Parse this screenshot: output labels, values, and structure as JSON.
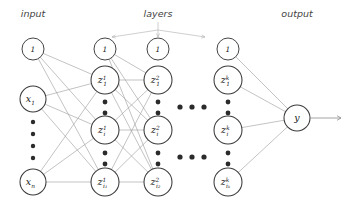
{
  "figure": {
    "type": "neural-network-diagram",
    "title": "",
    "background_color": "#ffffff",
    "node_stroke_color": "#3a3a3a",
    "edge_color": "#9a9a9a",
    "text_color": "#1a1a1a",
    "header_color": "#444444"
  },
  "headers": {
    "input": "input",
    "layers": "layers",
    "output": "output"
  },
  "columns": [
    {
      "id": "input",
      "header": "input",
      "x": 33,
      "nodes": [
        {
          "id": "input-bias",
          "kind": "bias",
          "base": "1",
          "sup": "",
          "sub": "",
          "cx": 33,
          "cy": 49,
          "r": 11
        },
        {
          "id": "input-x1",
          "kind": "unit",
          "base": "x",
          "sup": "",
          "sub": "1",
          "cx": 33,
          "cy": 99,
          "r": 13
        },
        {
          "id": "input-xn",
          "kind": "unit",
          "base": "x",
          "sup": "",
          "sub": "n",
          "cx": 33,
          "cy": 182,
          "r": 13
        }
      ],
      "vertical_ellipsis": [
        {
          "cx": 33,
          "cy": 122,
          "r": 2.2
        },
        {
          "cx": 33,
          "cy": 134,
          "r": 2.2
        },
        {
          "cx": 33,
          "cy": 146,
          "r": 2.2
        },
        {
          "cx": 33,
          "cy": 158,
          "r": 2.2
        }
      ]
    },
    {
      "id": "layer1",
      "header": "",
      "x": 105,
      "nodes": [
        {
          "id": "l1-bias",
          "kind": "bias",
          "base": "1",
          "sup": "",
          "sub": "",
          "cx": 105,
          "cy": 49,
          "r": 11
        },
        {
          "id": "l1-z1",
          "kind": "unit",
          "base": "z",
          "sup": "1",
          "sub": "1",
          "cx": 105,
          "cy": 80,
          "r": 14
        },
        {
          "id": "l1-zi",
          "kind": "unit",
          "base": "z",
          "sup": "1",
          "sub": "i",
          "cx": 105,
          "cy": 130,
          "r": 14
        },
        {
          "id": "l1-zi1",
          "kind": "unit",
          "base": "z",
          "sup": "1",
          "sub": "i₁",
          "cx": 105,
          "cy": 182,
          "r": 14
        }
      ],
      "vertical_ellipsis": [
        {
          "cx": 105,
          "cy": 102,
          "r": 2.4
        },
        {
          "cx": 105,
          "cy": 113,
          "r": 2.4
        },
        {
          "cx": 105,
          "cy": 153,
          "r": 2.4
        },
        {
          "cx": 105,
          "cy": 164,
          "r": 2.4
        }
      ]
    },
    {
      "id": "layer2",
      "header": "",
      "x": 158,
      "nodes": [
        {
          "id": "l2-bias",
          "kind": "bias",
          "base": "1",
          "sup": "",
          "sub": "",
          "cx": 158,
          "cy": 49,
          "r": 11
        },
        {
          "id": "l2-z1",
          "kind": "unit",
          "base": "z",
          "sup": "2",
          "sub": "1",
          "cx": 158,
          "cy": 80,
          "r": 14
        },
        {
          "id": "l2-zi",
          "kind": "unit",
          "base": "z",
          "sup": "2",
          "sub": "i",
          "cx": 158,
          "cy": 130,
          "r": 14
        },
        {
          "id": "l2-zi2",
          "kind": "unit",
          "base": "z",
          "sup": "2",
          "sub": "i₂",
          "cx": 158,
          "cy": 182,
          "r": 14
        }
      ],
      "vertical_ellipsis": [
        {
          "cx": 158,
          "cy": 102,
          "r": 2.4
        },
        {
          "cx": 158,
          "cy": 113,
          "r": 2.4
        },
        {
          "cx": 158,
          "cy": 153,
          "r": 2.4
        },
        {
          "cx": 158,
          "cy": 164,
          "r": 2.4
        }
      ]
    },
    {
      "id": "layerk",
      "header": "",
      "x": 228,
      "nodes": [
        {
          "id": "lk-bias",
          "kind": "bias",
          "base": "1",
          "sup": "",
          "sub": "",
          "cx": 228,
          "cy": 49,
          "r": 11
        },
        {
          "id": "lk-z1",
          "kind": "unit",
          "base": "z",
          "sup": "k",
          "sub": "1",
          "cx": 228,
          "cy": 80,
          "r": 14
        },
        {
          "id": "lk-zi",
          "kind": "unit",
          "base": "z",
          "sup": "k",
          "sub": "i",
          "cx": 228,
          "cy": 130,
          "r": 14
        },
        {
          "id": "lk-zik",
          "kind": "unit",
          "base": "z",
          "sup": "k",
          "sub": "iₖ",
          "cx": 228,
          "cy": 182,
          "r": 14
        }
      ],
      "vertical_ellipsis": [
        {
          "cx": 228,
          "cy": 102,
          "r": 2.4
        },
        {
          "cx": 228,
          "cy": 113,
          "r": 2.4
        },
        {
          "cx": 228,
          "cy": 153,
          "r": 2.4
        },
        {
          "cx": 228,
          "cy": 164,
          "r": 2.4
        }
      ]
    },
    {
      "id": "output",
      "header": "output",
      "x": 297,
      "nodes": [
        {
          "id": "output-y",
          "kind": "unit",
          "base": "y",
          "sup": "",
          "sub": "",
          "cx": 297,
          "cy": 118,
          "r": 13
        }
      ],
      "vertical_ellipsis": []
    }
  ],
  "horizontal_ellipsis": [
    {
      "cx": 180,
      "cy": 107,
      "r": 2.6
    },
    {
      "cx": 192,
      "cy": 107,
      "r": 2.6
    },
    {
      "cx": 204,
      "cy": 107,
      "r": 2.6
    },
    {
      "cx": 180,
      "cy": 157,
      "r": 2.6
    },
    {
      "cx": 192,
      "cy": 157,
      "r": 2.6
    },
    {
      "cx": 204,
      "cy": 157,
      "r": 2.6
    }
  ],
  "edges": [
    {
      "from": "input-bias",
      "to": "l1-z1"
    },
    {
      "from": "input-bias",
      "to": "l1-zi"
    },
    {
      "from": "input-bias",
      "to": "l1-zi1"
    },
    {
      "from": "input-x1",
      "to": "l1-z1"
    },
    {
      "from": "input-x1",
      "to": "l1-zi"
    },
    {
      "from": "input-x1",
      "to": "l1-zi1"
    },
    {
      "from": "input-xn",
      "to": "l1-z1"
    },
    {
      "from": "input-xn",
      "to": "l1-zi"
    },
    {
      "from": "input-xn",
      "to": "l1-zi1"
    },
    {
      "from": "l1-bias",
      "to": "l2-z1"
    },
    {
      "from": "l1-bias",
      "to": "l2-zi"
    },
    {
      "from": "l1-bias",
      "to": "l2-zi2"
    },
    {
      "from": "l1-z1",
      "to": "l2-z1"
    },
    {
      "from": "l1-z1",
      "to": "l2-zi"
    },
    {
      "from": "l1-z1",
      "to": "l2-zi2"
    },
    {
      "from": "l1-zi",
      "to": "l2-z1"
    },
    {
      "from": "l1-zi",
      "to": "l2-zi"
    },
    {
      "from": "l1-zi",
      "to": "l2-zi2"
    },
    {
      "from": "l1-zi1",
      "to": "l2-z1"
    },
    {
      "from": "l1-zi1",
      "to": "l2-zi"
    },
    {
      "from": "l1-zi1",
      "to": "l2-zi2"
    },
    {
      "from": "lk-bias",
      "to": "output-y"
    },
    {
      "from": "lk-z1",
      "to": "output-y"
    },
    {
      "from": "lk-zi",
      "to": "output-y"
    },
    {
      "from": "lk-zik",
      "to": "output-y"
    }
  ],
  "layers_pointer": {
    "origin_x": 158,
    "origin_y": 22,
    "stem_to_y": 30,
    "targets": [
      {
        "x": 112,
        "y": 37
      },
      {
        "x": 158,
        "y": 37
      },
      {
        "x": 205,
        "y": 37
      }
    ]
  },
  "output_arrow": {
    "from_x": 310,
    "to_x": 341,
    "y": 118
  },
  "header_positions": {
    "input": {
      "x": 33,
      "y": 17
    },
    "layers": {
      "x": 158,
      "y": 17
    },
    "output": {
      "x": 297,
      "y": 17
    }
  }
}
